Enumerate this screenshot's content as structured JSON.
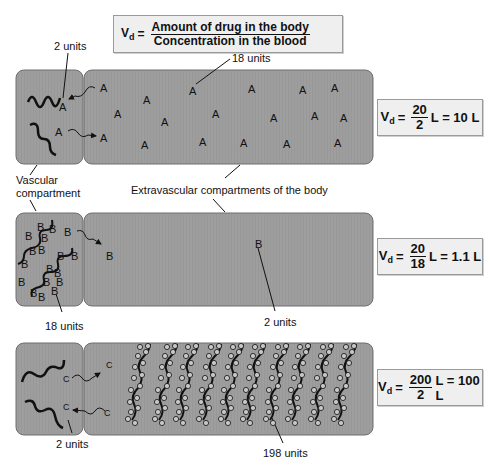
{
  "header": {
    "vd_symbol": "V",
    "vd_sub": "d",
    "equals": "=",
    "numerator": "Amount of drug in the body",
    "denominator": "Concentration in the blood"
  },
  "labels": {
    "vascular_line1": "Vascular",
    "vascular_line2": "compartment",
    "extravascular": "Extravascular compartments of the body"
  },
  "panels": [
    {
      "drug": "A",
      "vascular_units": "2 units",
      "extravascular_units": "18 units",
      "formula": {
        "num": "20",
        "den": "2",
        "result": "L = 10 L"
      }
    },
    {
      "drug": "B",
      "vascular_units": "18 units",
      "extravascular_units": "2 units",
      "formula": {
        "num": "20",
        "den": "18",
        "result": "L = 1.1 L"
      }
    },
    {
      "drug": "C",
      "vascular_units": "2 units",
      "extravascular_units": "198 units",
      "formula": {
        "num": "200",
        "den": "2",
        "result": "L = 100 L"
      }
    }
  ],
  "colors": {
    "compartment_fill": "#9c9c9c",
    "compartment_border": "#6e6e6e",
    "formula_bg": "#efefef"
  }
}
